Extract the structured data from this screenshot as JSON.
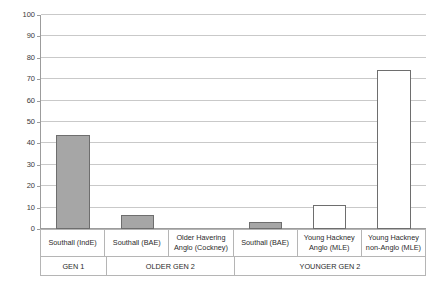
{
  "chart_data": {
    "type": "bar",
    "title": "",
    "subtitle": "",
    "xlabel": "",
    "ylabel": "",
    "ylim": [
      0,
      100
    ],
    "ytick_step": 10,
    "grid": true,
    "legend": null,
    "categories": [
      "Southall (IndE)",
      "Southall (BAE)",
      "Older Havering Anglo (Cockney)",
      "Southall (BAE)",
      "Young Hackney Anglo (MLE)",
      "Young Hackney non-Anglo (MLE)"
    ],
    "values": [
      44,
      6.5,
      0,
      3.5,
      11,
      74.5
    ],
    "bar_styles": [
      "filled",
      "filled",
      "empty",
      "filled",
      "hollow",
      "hollow"
    ],
    "yticks": [
      "0",
      "10",
      "20",
      "30",
      "40",
      "50",
      "60",
      "70",
      "80",
      "90",
      "100"
    ],
    "groups": [
      {
        "label": "GEN 1",
        "span": 1
      },
      {
        "label": "OLDER GEN 2",
        "span": 2
      },
      {
        "label": "YOUNGER GEN 2",
        "span": 3
      }
    ],
    "colors": {
      "bar_fill": "#a6a6a6",
      "bar_hollow": "#ffffff",
      "bar_border": "#6e6e6e",
      "gridline": "#c9c9c9",
      "axis": "#9c9c9c",
      "text": "#2b2b2b"
    }
  }
}
